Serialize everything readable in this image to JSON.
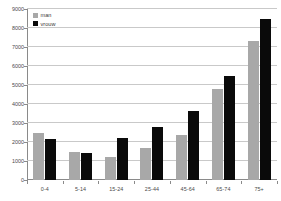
{
  "chart_data": {
    "type": "bar",
    "title": "",
    "xlabel": "",
    "ylabel": "",
    "grid": true,
    "legend_position": "top-left",
    "categories": [
      "0-4",
      "5-14",
      "15-24",
      "25-44",
      "45-64",
      "65-74",
      "75+"
    ],
    "ylim": [
      0,
      9000
    ],
    "ytick_values": [
      0,
      1000,
      2000,
      3000,
      4000,
      5000,
      6000,
      7000,
      8000,
      9000
    ],
    "ytick_labels": [
      "0",
      "1000",
      "2000",
      "3000",
      "4000",
      "5000",
      "6000",
      "7000",
      "8000",
      "9000"
    ],
    "series": [
      {
        "name": "man",
        "color": "#a8a8a8",
        "values": [
          2470,
          1450,
          1200,
          1700,
          2350,
          4800,
          7300
        ]
      },
      {
        "name": "vrouw",
        "color": "#0a0a0a",
        "values": [
          2160,
          1420,
          2230,
          2800,
          3650,
          5500,
          8500
        ]
      }
    ]
  },
  "legend": {
    "items": [
      {
        "label": "man",
        "color": "#a8a8a8"
      },
      {
        "label": "vrouw",
        "color": "#0a0a0a"
      }
    ]
  },
  "colors": {
    "man": "#a8a8a8",
    "vrouw": "#0a0a0a",
    "grid": "#c9c9c9",
    "axis": "#8a8a8a",
    "text": "#4a4a4a",
    "background": "#ffffff"
  }
}
